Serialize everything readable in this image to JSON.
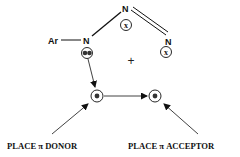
{
  "diagram": {
    "atoms": {
      "ar": "Ar",
      "n_left": "N",
      "n_top": "N",
      "n_right": "N"
    },
    "substituents": {
      "x_top": "x",
      "x_right": "x"
    },
    "operator": "+",
    "labels": {
      "donor": "PLACE π DONOR",
      "acceptor": "PLACE π ACCEPTOR"
    },
    "colors": {
      "ink": "#111111",
      "background": "#ffffff"
    }
  }
}
